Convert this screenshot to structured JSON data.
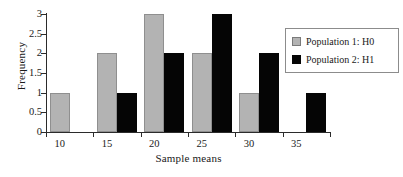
{
  "chart_data": {
    "type": "bar",
    "title": "",
    "xlabel": "Sample means",
    "ylabel": "Frequency",
    "categories": [
      "10",
      "15",
      "20",
      "25",
      "30",
      "35"
    ],
    "series": [
      {
        "name": "Population 1: H0",
        "color": "#b3b3b3",
        "values": [
          1,
          2,
          3,
          2,
          1,
          0
        ]
      },
      {
        "name": "Population 2: H1",
        "color": "#000000",
        "values": [
          0,
          1,
          2,
          3,
          2,
          1
        ]
      }
    ],
    "ylim": [
      0,
      3
    ],
    "yticks": [
      "0",
      "0.5",
      "1",
      "1.5",
      "2",
      "2.5",
      "3"
    ],
    "ytick_values": [
      0,
      0.5,
      1,
      1.5,
      2,
      2.5,
      3
    ],
    "xticks": [
      "10",
      "15",
      "20",
      "25",
      "30",
      "35"
    ],
    "grid": false,
    "legend_position": "top-right"
  },
  "legend": {
    "entries": [
      {
        "label": "Population 1: H0",
        "swatch": "gray"
      },
      {
        "label": "Population 2: H1",
        "swatch": "black"
      }
    ]
  },
  "colors": {
    "series_1": "#b3b3b3",
    "series_1_border": "#8f8f8f",
    "series_2": "#050505",
    "axis": "#2b2b2b",
    "background": "#ffffff",
    "legend_border": "#8c8c8c"
  }
}
